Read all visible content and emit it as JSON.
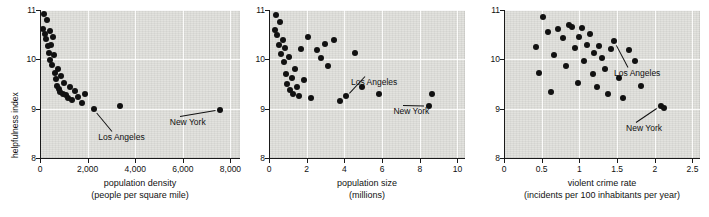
{
  "chart_data": [
    {
      "type": "scatter",
      "panel": 1,
      "xlabel_line1": "population density",
      "xlabel_line2": "(people per square mile)",
      "ylabel": "helpfulness index",
      "xticks": [
        "0",
        "2,000",
        "4,000",
        "6,000",
        "8,000"
      ],
      "xtickvals": [
        0,
        2000,
        4000,
        6000,
        8000
      ],
      "yticks": [
        "8",
        "9",
        "10",
        "11"
      ],
      "ytickvals": [
        8,
        9,
        10,
        11
      ],
      "xlim": [
        0,
        8400
      ],
      "ylim": [
        8,
        11
      ],
      "grid": true,
      "annotations": [
        {
          "label": "Los Angeles",
          "x": 2450,
          "y": 8.42
        },
        {
          "label": "New York",
          "x": 5450,
          "y": 8.72
        }
      ],
      "points": [
        [
          120,
          10.62
        ],
        [
          160,
          10.92
        ],
        [
          200,
          10.52
        ],
        [
          240,
          10.42
        ],
        [
          300,
          10.8
        ],
        [
          330,
          10.28
        ],
        [
          360,
          10.12
        ],
        [
          400,
          10.58
        ],
        [
          430,
          9.98
        ],
        [
          470,
          10.3
        ],
        [
          520,
          9.88
        ],
        [
          560,
          10.46
        ],
        [
          600,
          10.08
        ],
        [
          640,
          9.72
        ],
        [
          680,
          9.6
        ],
        [
          720,
          9.46
        ],
        [
          760,
          9.8
        ],
        [
          800,
          9.4
        ],
        [
          860,
          9.34
        ],
        [
          900,
          9.66
        ],
        [
          960,
          9.3
        ],
        [
          1020,
          9.52
        ],
        [
          1100,
          9.28
        ],
        [
          1180,
          9.22
        ],
        [
          1250,
          9.44
        ],
        [
          1350,
          9.18
        ],
        [
          1480,
          9.36
        ],
        [
          1600,
          9.24
        ],
        [
          1750,
          9.12
        ],
        [
          1900,
          9.3
        ],
        [
          2250,
          9.0
        ],
        [
          3350,
          9.06
        ],
        [
          7550,
          8.98
        ]
      ]
    },
    {
      "type": "scatter",
      "panel": 2,
      "xlabel_line1": "population size",
      "xlabel_line2": "(millions)",
      "ylabel": "",
      "xticks": [
        "0",
        "2",
        "4",
        "6",
        "8",
        "10"
      ],
      "xtickvals": [
        0,
        2,
        4,
        6,
        8,
        10
      ],
      "yticks": [
        "8",
        "9",
        "10",
        "11"
      ],
      "ytickvals": [
        8,
        9,
        10,
        11
      ],
      "xlim": [
        0,
        10.4
      ],
      "ylim": [
        8,
        11
      ],
      "grid": true,
      "annotations": [
        {
          "label": "Los Angeles",
          "x": 4.35,
          "y": 9.55
        },
        {
          "label": "New York",
          "x": 6.6,
          "y": 8.95
        }
      ],
      "points": [
        [
          0.3,
          10.6
        ],
        [
          0.38,
          10.9
        ],
        [
          0.45,
          10.5
        ],
        [
          0.52,
          10.3
        ],
        [
          0.6,
          10.75
        ],
        [
          0.66,
          10.1
        ],
        [
          0.72,
          10.4
        ],
        [
          0.8,
          9.95
        ],
        [
          0.86,
          10.22
        ],
        [
          0.92,
          9.7
        ],
        [
          0.98,
          9.5
        ],
        [
          1.05,
          10.05
        ],
        [
          1.12,
          9.38
        ],
        [
          1.2,
          9.62
        ],
        [
          1.28,
          9.3
        ],
        [
          1.38,
          9.8
        ],
        [
          1.48,
          9.44
        ],
        [
          1.58,
          9.26
        ],
        [
          1.7,
          10.2
        ],
        [
          1.85,
          9.58
        ],
        [
          2.05,
          10.45
        ],
        [
          2.25,
          9.22
        ],
        [
          2.55,
          10.18
        ],
        [
          2.75,
          10.02
        ],
        [
          2.95,
          10.32
        ],
        [
          3.15,
          9.86
        ],
        [
          3.45,
          10.4
        ],
        [
          3.75,
          9.16
        ],
        [
          4.1,
          9.26
        ],
        [
          4.55,
          10.12
        ],
        [
          4.95,
          9.44
        ],
        [
          5.85,
          9.3
        ],
        [
          8.5,
          9.06
        ],
        [
          8.65,
          9.3
        ]
      ]
    },
    {
      "type": "scatter",
      "panel": 3,
      "xlabel_line1": "violent crime rate",
      "xlabel_line2": "(incidents per 100 inhabitants per year)",
      "ylabel": "",
      "xticks": [
        "0",
        "0.5",
        "1",
        "1.5",
        "2",
        "2.5"
      ],
      "xtickvals": [
        0,
        0.5,
        1,
        1.5,
        2,
        2.5
      ],
      "yticks": [
        "8",
        "9",
        "10",
        "11"
      ],
      "ytickvals": [
        8,
        9,
        10,
        11
      ],
      "xlim": [
        0,
        2.6
      ],
      "ylim": [
        8,
        11
      ],
      "grid": true,
      "annotations": [
        {
          "label": "Los Angeles",
          "x": 1.46,
          "y": 9.72
        },
        {
          "label": "New York",
          "x": 1.62,
          "y": 8.6
        }
      ],
      "points": [
        [
          0.42,
          10.24
        ],
        [
          0.46,
          9.72
        ],
        [
          0.52,
          10.86
        ],
        [
          0.58,
          10.56
        ],
        [
          0.62,
          9.34
        ],
        [
          0.66,
          10.08
        ],
        [
          0.72,
          10.62
        ],
        [
          0.78,
          10.44
        ],
        [
          0.82,
          9.86
        ],
        [
          0.86,
          10.7
        ],
        [
          0.9,
          10.66
        ],
        [
          0.94,
          10.22
        ],
        [
          0.98,
          9.52
        ],
        [
          1.0,
          10.46
        ],
        [
          1.04,
          10.64
        ],
        [
          1.06,
          9.96
        ],
        [
          1.1,
          10.3
        ],
        [
          1.14,
          10.52
        ],
        [
          1.18,
          9.7
        ],
        [
          1.2,
          10.12
        ],
        [
          1.24,
          9.44
        ],
        [
          1.26,
          10.28
        ],
        [
          1.3,
          10.02
        ],
        [
          1.34,
          9.8
        ],
        [
          1.38,
          9.3
        ],
        [
          1.42,
          10.2
        ],
        [
          1.46,
          10.38
        ],
        [
          1.52,
          9.62
        ],
        [
          1.58,
          9.22
        ],
        [
          1.66,
          10.18
        ],
        [
          1.74,
          9.96
        ],
        [
          1.82,
          9.46
        ],
        [
          2.08,
          9.06
        ],
        [
          2.12,
          9.02
        ]
      ]
    }
  ]
}
